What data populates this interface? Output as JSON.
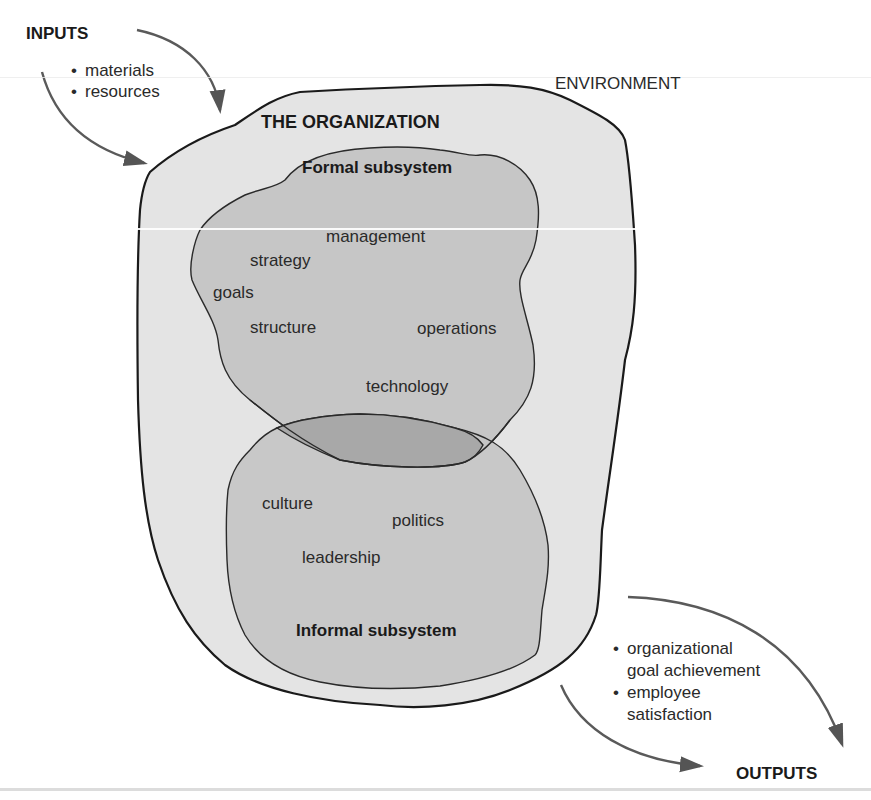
{
  "environment": {
    "label": "ENVIRONMENT"
  },
  "inputs": {
    "heading": "INPUTS",
    "items": [
      "materials",
      "resources"
    ]
  },
  "organization": {
    "label": "THE ORGANIZATION"
  },
  "formal_subsystem": {
    "label": "Formal subsystem",
    "items": {
      "management": "management",
      "strategy": "strategy",
      "goals": "goals",
      "structure": "structure",
      "operations": "operations",
      "technology": "technology"
    }
  },
  "informal_subsystem": {
    "label": "Informal subsystem",
    "items": {
      "culture": "culture",
      "politics": "politics",
      "leadership": "leadership"
    }
  },
  "outputs": {
    "heading": "OUTPUTS",
    "items": [
      "organizational goal achievement",
      "employee satisfaction"
    ],
    "item_lines": [
      [
        "organizational",
        "goal achievement"
      ],
      [
        "employee",
        "satisfaction"
      ]
    ]
  },
  "colors": {
    "organization_fill": "#e4e4e4",
    "subsystem_fill": "#c6c6c6",
    "overlap_fill": "#a8a8a8",
    "outline": "#1a1a1a",
    "arrow": "#5a5a5a",
    "background": "#ffffff"
  }
}
